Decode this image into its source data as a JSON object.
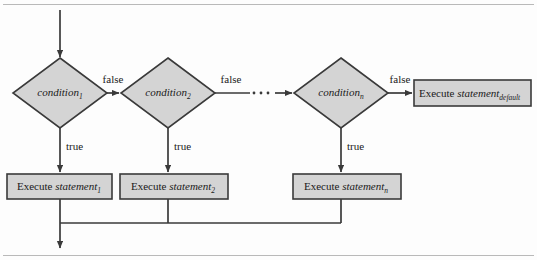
{
  "figure": {
    "colors": {
      "shape_fill": "#d4d4d4",
      "shape_stroke": "#3a3a3a",
      "line": "#3a3a3a",
      "background": "#fdfdfd",
      "frame_rule": "#b9b9b9"
    }
  },
  "decisions": [
    {
      "name": "condition-1",
      "word": "condition",
      "subscript": "1"
    },
    {
      "name": "condition-2",
      "word": "condition",
      "subscript": "2"
    },
    {
      "name": "condition-n",
      "word": "condition",
      "subscript": "n"
    }
  ],
  "processes": [
    {
      "name": "execute-statement-1",
      "prefix": "Execute",
      "word": "statement",
      "subscript": "1"
    },
    {
      "name": "execute-statement-2",
      "prefix": "Execute",
      "word": "statement",
      "subscript": "2"
    },
    {
      "name": "execute-statement-n",
      "prefix": "Execute",
      "word": "statement",
      "subscript": "n"
    },
    {
      "name": "execute-statement-default",
      "prefix": "Execute",
      "word": "statement",
      "subscript": "default"
    }
  ],
  "edge_labels": {
    "false_1": "false",
    "false_2": "false",
    "false_n": "false",
    "true_1": "true",
    "true_2": "true",
    "true_n": "true"
  },
  "ellipsis": "· · ·"
}
